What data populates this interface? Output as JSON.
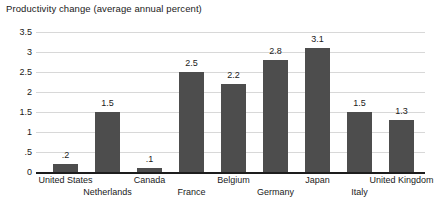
{
  "chart_data": {
    "type": "bar",
    "title": "Productivity change (average annual percent)",
    "xlabel": "",
    "ylabel": "",
    "ylim": [
      0,
      3.5
    ],
    "ytick_labels": [
      "0",
      ".5",
      "1",
      "1.5",
      "2",
      "2.5",
      "3",
      "3.5"
    ],
    "ytick_values": [
      0,
      0.5,
      1,
      1.5,
      2,
      2.5,
      3,
      3.5
    ],
    "grid": true,
    "legend": "none",
    "categories": [
      "United States",
      "Netherlands",
      "Canada",
      "France",
      "Belgium",
      "Germany",
      "Japan",
      "Italy",
      "United Kingdom"
    ],
    "values": [
      0.2,
      1.5,
      0.1,
      2.5,
      2.2,
      2.8,
      3.1,
      1.5,
      1.3
    ],
    "value_labels": [
      ".2",
      "1.5",
      ".1",
      "2.5",
      "2.2",
      "2.8",
      "3.1",
      "1.5",
      "1.3"
    ],
    "label_rows": [
      0,
      1,
      0,
      1,
      0,
      1,
      0,
      1,
      0
    ],
    "bar_color": "#4d4d4d",
    "grid_color": "#d8d8d8",
    "axis_color": "#1d1d1d",
    "text_color": "#1a1a1a"
  }
}
